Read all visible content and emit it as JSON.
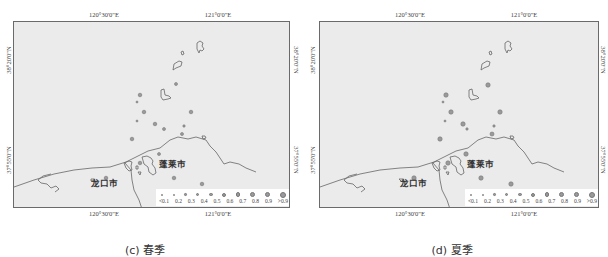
{
  "panels": [
    {
      "id": "left",
      "caption": "(c) 春季",
      "top_ticks": [
        "120°30'0\"E",
        "121°0'0\"E"
      ],
      "bottom_ticks": [
        "120°30'0\"E",
        "121°0'0\"E"
      ],
      "left_ticks": [
        "38°20'0\"N",
        "37°55'0\"N"
      ],
      "right_ticks": [
        "38°20'0\"N",
        "37°55'0\"N"
      ],
      "cities": [
        "蓬莱市",
        "龙口市"
      ]
    },
    {
      "id": "right",
      "caption": "(d) 夏季",
      "top_ticks": [
        "120°30'0\"E",
        "121°0'0\"E"
      ],
      "bottom_ticks": [
        "120°30'0\"E",
        "121°0'0\"E"
      ],
      "left_ticks": [
        "38°20'0\"N",
        "37°55'0\"N"
      ],
      "right_ticks": [
        "38°20'0\"N",
        "37°55'0\"N"
      ],
      "cities": [
        "蓬莱市",
        "龙口市"
      ]
    }
  ],
  "legend": {
    "labels": [
      "<0.1",
      "0.2",
      "0.3",
      "0.4",
      "0.5",
      "0.6",
      "0.7",
      "0.8",
      "0.9",
      ">0.9"
    ],
    "sizes": [
      1.5,
      2,
      2.5,
      3,
      3.5,
      4,
      4.5,
      5,
      5.5,
      6
    ]
  },
  "colors": {
    "sea": "#ebebeb",
    "frame": "#6a6a6a",
    "coast": "#666666",
    "station": "#9a9a9a"
  }
}
